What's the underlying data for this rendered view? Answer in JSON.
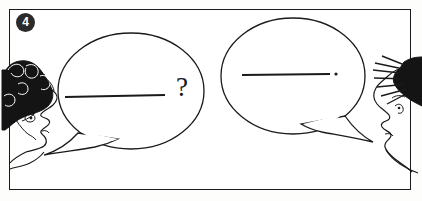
{
  "panel": {
    "number": "4",
    "border_color": "#1a1a1a",
    "background_color": "#ffffff",
    "ink_color": "#1a1a1a",
    "badge_background": "#2b2b2b",
    "badge_text_color": "#ffffff"
  },
  "characters": [
    {
      "id": "left-character",
      "position": "left",
      "facing": "right",
      "hair": "curly-dark-hair",
      "role": "asker"
    },
    {
      "id": "right-character",
      "position": "right",
      "facing": "left",
      "hair": "spiky-dark-hair",
      "role": "answerer"
    }
  ],
  "speech_bubbles": [
    {
      "id": "left-bubble",
      "speaker": "left-character",
      "shape": "ellipse",
      "tail_direction": "down-left",
      "content_line": "——————",
      "punctuation": "?",
      "meaning": "question"
    },
    {
      "id": "right-bubble",
      "speaker": "right-character",
      "shape": "ellipse",
      "tail_direction": "down-right",
      "content_line": "——————",
      "punctuation": ".",
      "meaning": "statement"
    }
  ]
}
